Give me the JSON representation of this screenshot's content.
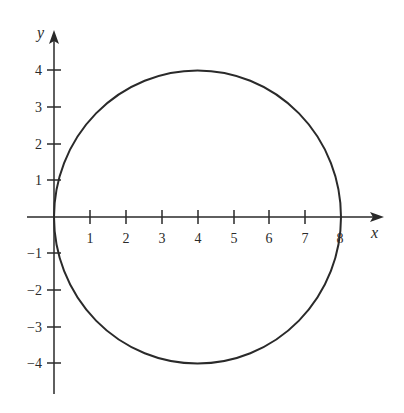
{
  "figure": {
    "x_axis_label": "x",
    "y_axis_label": "y",
    "x_ticks": [
      "1",
      "2",
      "3",
      "4",
      "5",
      "6",
      "7",
      "8"
    ],
    "y_ticks_positive": [
      "4",
      "3",
      "2",
      "1"
    ],
    "y_ticks_negative": [
      "−1",
      "−2",
      "−3",
      "−4"
    ],
    "circle": {
      "center_x": 4,
      "center_y": 0,
      "radius": 4
    },
    "colors": {
      "stroke": "#2a2a2a",
      "background": "#ffffff"
    }
  }
}
